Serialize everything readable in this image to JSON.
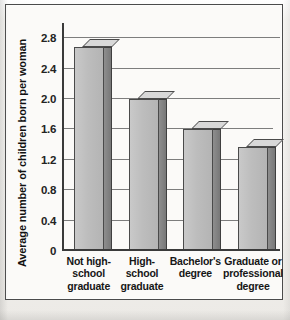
{
  "chart_data": {
    "type": "bar",
    "title": "",
    "subtitle": "",
    "xlabel": "",
    "ylabel": "Average number of children born per woman",
    "categories": [
      "Not high-school graduate",
      "High-school graduate",
      "Bachelor's degree",
      "Graduate or professional degree"
    ],
    "category_lines": [
      [
        "Not high-",
        "school",
        "graduate"
      ],
      [
        "High-",
        "school",
        "graduate"
      ],
      [
        "Bachelor's",
        "degree"
      ],
      [
        "Graduate or",
        "professional",
        "degree"
      ]
    ],
    "values": [
      2.69,
      2.0,
      1.6,
      1.37
    ],
    "series": [
      {
        "name": "Average number of children born per woman",
        "values": [
          2.69,
          2.0,
          1.6,
          1.37
        ]
      }
    ],
    "ylim": [
      0,
      3.0
    ],
    "yticks": [
      0,
      0.4,
      0.8,
      1.2,
      1.6,
      2.0,
      2.4,
      2.8
    ],
    "ytick_labels": [
      "0",
      "0.4",
      "0.8",
      "1.2",
      "1.6",
      "2.0",
      "2.4",
      "2.8"
    ],
    "grid": true,
    "grid_axis": "y",
    "legend": false,
    "legend_position": "none",
    "bar_style": "3d-block",
    "colors": {
      "bar_face": "#bdbdbd",
      "bar_side": "#7d7d7d",
      "bar_top": "#d8d8d8",
      "bar_outline": "#4a4a4a",
      "gridline": "#7d7d7d",
      "axis": "#3a3a3a",
      "plot_background": "#fbfaf8",
      "page_background": "#f2f1ee",
      "frame_border": "#4b4b4b",
      "text": "#161616"
    }
  },
  "axis": {
    "y_title": "Average number of children born per woman",
    "zero_label": "0"
  }
}
